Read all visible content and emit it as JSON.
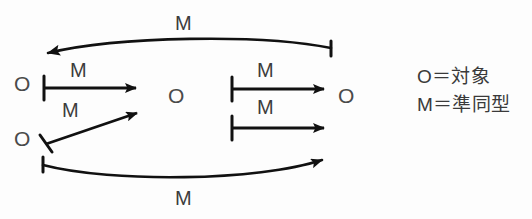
{
  "diagram": {
    "ink_color": "#111111",
    "text_color": "#444444",
    "background_color": "#ffffff",
    "nodes": [
      {
        "id": "o-left-upper",
        "label": "O",
        "x": 14,
        "y": 73
      },
      {
        "id": "o-left-lower",
        "label": "O",
        "x": 14,
        "y": 128
      },
      {
        "id": "o-center",
        "label": "O",
        "x": 168,
        "y": 85
      },
      {
        "id": "o-right",
        "label": "O",
        "x": 338,
        "y": 85
      }
    ],
    "edge_labels": [
      {
        "id": "m-top-curve",
        "label": "M",
        "x": 175,
        "y": 13
      },
      {
        "id": "m-left-upper",
        "label": "M",
        "x": 70,
        "y": 60
      },
      {
        "id": "m-left-lower",
        "label": "M",
        "x": 62,
        "y": 100
      },
      {
        "id": "m-right-upper",
        "label": "M",
        "x": 257,
        "y": 60
      },
      {
        "id": "m-right-lower",
        "label": "M",
        "x": 257,
        "y": 97
      },
      {
        "id": "m-bottom-curve",
        "label": "M",
        "x": 175,
        "y": 188
      }
    ],
    "legend": {
      "object_line": "O＝対象",
      "morphism_line": "M＝準同型"
    }
  }
}
